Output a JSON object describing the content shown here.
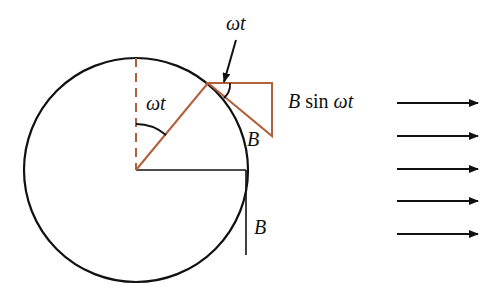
{
  "diagram": {
    "colors": {
      "line": "#111111",
      "accent": "#b0603a"
    },
    "labels": {
      "omega_t_top": "ωt",
      "omega_t_center": "ωt",
      "b_sin_prefix": "B",
      "b_sin_func": " sin ",
      "b_sin_angle": "ωt",
      "b_hypotenuse": "B",
      "b_bottom": "B"
    },
    "field_arrows": {
      "count": 5,
      "direction": "right"
    }
  }
}
